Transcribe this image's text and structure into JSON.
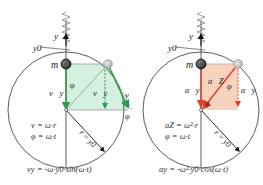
{
  "left_panel": {
    "title": "velocity",
    "labels": {
      "y_axis": "y",
      "y0": "y0",
      "mass": "m",
      "vy_left": "v⃗y",
      "vy_right": "v⃗y",
      "v": "v⃗",
      "phi_inner": "φ",
      "phi_outer": "φ",
      "radius": "r = y0"
    },
    "equations": [
      "v = ω·r",
      "φ = ω·t"
    ],
    "bottom_formula": "vy = -ω·y0·sin(ω·t)",
    "accent_color": "#2e9b4a",
    "fill_color": "#cfeedd"
  },
  "right_panel": {
    "title": "acceleration",
    "labels": {
      "y_axis": "y",
      "y0": "y0",
      "mass": "m",
      "ay_left": "a⃗y",
      "ay_right": "a⃗y",
      "az": "a⃗Z",
      "phi_inner": "φ",
      "phi_center": "φ",
      "radius": "r = y0"
    },
    "equations": [
      "aZ = ω²·r",
      "φ = ω·t"
    ],
    "bottom_formula": "ay = -ω²·y0·cos(ω·t)",
    "accent_color": "#e0402a",
    "fill_color": "#f6cdb8"
  }
}
